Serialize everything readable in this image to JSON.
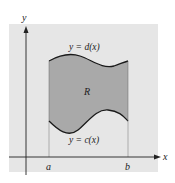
{
  "diagram": {
    "axes": {
      "x_label": "x",
      "y_label": "y"
    },
    "bounds": {
      "left_label": "a",
      "right_label": "b"
    },
    "curves": {
      "upper_label": "y = d(x)",
      "lower_label": "y = c(x)"
    },
    "region_label": "R",
    "colors": {
      "background_panel": "#e6e6e6",
      "region_fill": "#a9a9a9",
      "curve_stroke": "#1a1a1a",
      "axis_stroke": "#222222",
      "guide_line": "#888888"
    }
  }
}
